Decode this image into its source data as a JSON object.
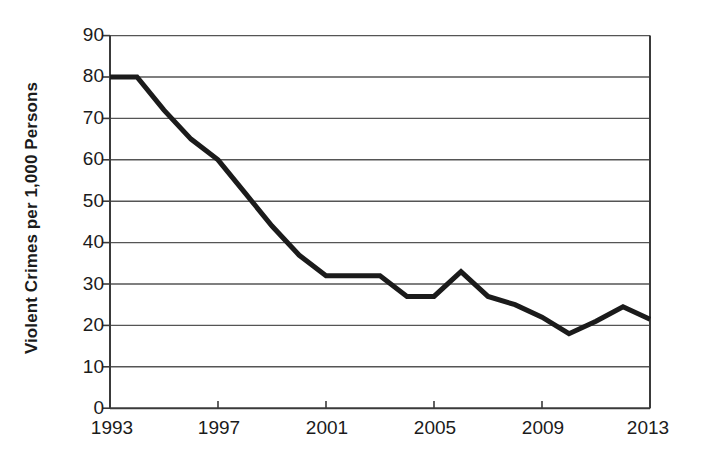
{
  "chart_data": {
    "type": "line",
    "title": "",
    "xlabel": "",
    "ylabel": "Violent Crimes per 1,000 Persons",
    "xlim": [
      1993,
      2013
    ],
    "ylim": [
      0,
      90
    ],
    "grid": true,
    "legend": "none",
    "y_ticks": [
      90,
      80,
      70,
      60,
      50,
      40,
      30,
      20,
      10,
      0
    ],
    "x_ticks": [
      1993,
      1997,
      2001,
      2005,
      2009,
      2013
    ],
    "x": [
      1993,
      1994,
      1995,
      1996,
      1997,
      1998,
      1999,
      2000,
      2001,
      2002,
      2003,
      2004,
      2005,
      2006,
      2007,
      2008,
      2009,
      2010,
      2011,
      2012,
      2013
    ],
    "values": [
      80,
      80,
      72,
      65,
      60,
      52,
      44,
      37,
      32,
      32,
      32,
      27,
      27,
      33,
      27,
      25,
      22,
      18,
      21,
      24.5,
      21.5
    ],
    "series": [
      {
        "name": "Violent crime rate",
        "color": "#1b1b1b",
        "values": [
          80,
          80,
          72,
          65,
          60,
          52,
          44,
          37,
          32,
          32,
          32,
          27,
          27,
          33,
          27,
          25,
          22,
          18,
          21,
          24.5,
          21.5
        ]
      }
    ],
    "axis_color": "#3a3a3a",
    "grid_color": "#5a5a5a",
    "background": "#ffffff"
  },
  "axis": {
    "y_title": "Violent Crimes per 1,000 Persons",
    "y_labels": {
      "t90": "90",
      "t80": "80",
      "t70": "70",
      "t60": "60",
      "t50": "50",
      "t40": "40",
      "t30": "30",
      "t20": "20",
      "t10": "10",
      "t0": "0"
    },
    "x_labels": {
      "t1993": "1993",
      "t1997": "1997",
      "t2001": "2001",
      "t2005": "2005",
      "t2009": "2009",
      "t2013": "2013"
    }
  }
}
